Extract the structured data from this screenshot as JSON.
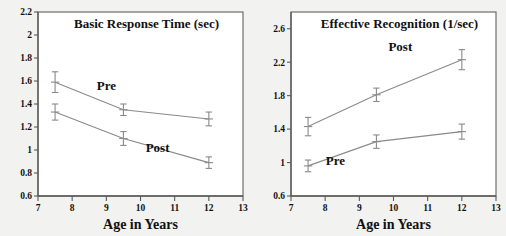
{
  "figure": {
    "background_color": "#f2f2f0",
    "panel_background": "#ffffff",
    "line_color": "#8a8a8a",
    "axis_color": "#5a5a5a"
  },
  "chart_data": [
    {
      "type": "line",
      "panel": "left",
      "title": "Basic Response Time (sec)",
      "xlabel": "Age in Years",
      "ylabel": "",
      "xlim": [
        7,
        13
      ],
      "ylim": [
        0.6,
        2.2
      ],
      "xticks": [
        "7",
        "8",
        "9",
        "10",
        "11",
        "12",
        "13"
      ],
      "xtick_values": [
        7,
        8,
        9,
        10,
        11,
        12,
        13
      ],
      "yticks": [
        "0.6",
        "0.8",
        "1",
        "1.2",
        "1.4",
        "1.6",
        "1.8",
        "2",
        "2.2"
      ],
      "ytick_values": [
        0.6,
        0.8,
        1.0,
        1.2,
        1.4,
        1.6,
        1.8,
        2.0,
        2.2
      ],
      "grid": false,
      "legend": "inline-annotations",
      "x": [
        7.5,
        9.5,
        12.0
      ],
      "series": [
        {
          "name": "Pre",
          "label": "Pre",
          "label_x": 9.0,
          "label_y": 1.52,
          "values": [
            1.59,
            1.35,
            1.27
          ],
          "errors": [
            0.09,
            0.05,
            0.06
          ]
        },
        {
          "name": "Post",
          "label": "Post",
          "label_x": 10.5,
          "label_y": 0.98,
          "values": [
            1.33,
            1.1,
            0.89
          ],
          "errors": [
            0.07,
            0.06,
            0.05
          ]
        }
      ]
    },
    {
      "type": "line",
      "panel": "right",
      "title": "Effective Recognition (1/sec)",
      "xlabel": "Age in Years",
      "ylabel": "",
      "xlim": [
        7,
        13
      ],
      "ylim": [
        0.6,
        2.8
      ],
      "xticks": [
        "7",
        "8",
        "9",
        "10",
        "11",
        "12",
        "13"
      ],
      "xtick_values": [
        7,
        8,
        9,
        10,
        11,
        12,
        13
      ],
      "yticks": [
        "0.6",
        "1",
        "1.4",
        "1.8",
        "2.2",
        "2.6"
      ],
      "ytick_values": [
        0.6,
        1.0,
        1.4,
        1.8,
        2.2,
        2.6
      ],
      "grid": false,
      "legend": "inline-annotations",
      "x": [
        7.5,
        9.5,
        12.0
      ],
      "series": [
        {
          "name": "Post",
          "label": "Post",
          "label_x": 10.2,
          "label_y": 2.33,
          "values": [
            1.43,
            1.81,
            2.23
          ],
          "errors": [
            0.11,
            0.08,
            0.12
          ]
        },
        {
          "name": "Pre",
          "label": "Pre",
          "label_x": 8.3,
          "label_y": 0.97,
          "values": [
            0.96,
            1.25,
            1.37
          ],
          "errors": [
            0.07,
            0.08,
            0.09
          ]
        }
      ]
    }
  ]
}
